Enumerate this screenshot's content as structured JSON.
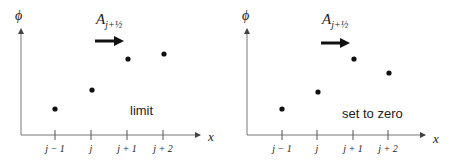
{
  "panels": [
    {
      "id": "left",
      "y_axis_label": "ϕ",
      "x_axis_label": "x",
      "flux_label_main": "A",
      "flux_label_sub": "j+½",
      "annotation": "limit",
      "tick_labels": [
        "j − 1",
        "j",
        "j + 1",
        "j + 2"
      ],
      "points": [
        [
          55,
          109
        ],
        [
          92,
          90
        ],
        [
          128,
          59
        ],
        [
          164,
          54
        ]
      ]
    },
    {
      "id": "right",
      "y_axis_label": "ϕ",
      "x_axis_label": "x",
      "flux_label_main": "A",
      "flux_label_sub": "j+½",
      "annotation": "set to zero",
      "tick_labels": [
        "j − 1",
        "j",
        "j + 1",
        "j + 2"
      ],
      "points": [
        [
          282,
          109
        ],
        [
          318,
          92
        ],
        [
          354,
          59
        ],
        [
          389,
          73
        ]
      ]
    }
  ],
  "colors": {
    "ink": "#222222",
    "background": "#ffffff"
  }
}
